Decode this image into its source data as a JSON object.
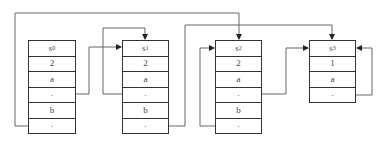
{
  "diagram": {
    "frames": [
      {
        "id": "frame-0",
        "name": "s",
        "subscript": "0",
        "cells": [
          "2",
          "a",
          "·",
          "b",
          "·"
        ]
      },
      {
        "id": "frame-1",
        "name": "s",
        "subscript": "1",
        "cells": [
          "2",
          "a",
          "·",
          "b",
          "·"
        ]
      },
      {
        "id": "frame-2",
        "name": "s",
        "subscript": "2",
        "cells": [
          "2",
          "a",
          "·",
          "b",
          "·"
        ]
      },
      {
        "id": "frame-3",
        "name": "s",
        "subscript": "3",
        "cells": [
          "1",
          "a",
          "·"
        ]
      }
    ],
    "colors": {
      "line": "#555555",
      "border": "#333333",
      "background": "#ffffff"
    }
  }
}
